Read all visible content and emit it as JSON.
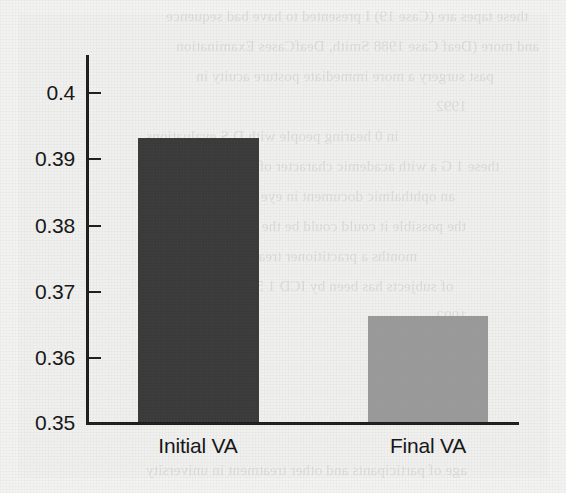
{
  "figure": {
    "kind": "scanned-journal-figure",
    "panel_background": "#f0f0ef",
    "page_background": "#f3f3f2",
    "axis_color": "#1d1d1d",
    "text_color": "#151515"
  },
  "chart_data": {
    "type": "bar",
    "title": "",
    "subtitle": "",
    "xlabel": "",
    "ylabel": "",
    "categories": [
      "Initial VA",
      "Final VA"
    ],
    "values": [
      0.393,
      0.366
    ],
    "bar_colors": [
      "#3a3a3a",
      "#9a9a9a"
    ],
    "ylim": [
      0.35,
      0.403
    ],
    "yticks": [
      0.35,
      0.36,
      0.37,
      0.38,
      0.39,
      0.4
    ],
    "ytick_labels": [
      "0.35",
      "0.36",
      "0.37",
      "0.38",
      "0.39",
      "0.4"
    ],
    "xtick_labels": [
      "Initial VA",
      "Final VA"
    ],
    "grid": false,
    "legend": false,
    "legend_position": "none",
    "tick_direction": "in",
    "series": [
      {
        "name": "Visual acuity",
        "points": [
          {
            "category": "Initial VA",
            "value": 0.393,
            "color": "#3a3a3a"
          },
          {
            "category": "Final VA",
            "value": 0.366,
            "color": "#9a9a9a"
          }
        ]
      }
    ]
  },
  "axis": {
    "y_tick_labels": [
      "0.4",
      "0.39",
      "0.38",
      "0.37",
      "0.36",
      "0.35"
    ],
    "x_tick_labels": [
      "Initial VA",
      "Final VA"
    ]
  },
  "bleed_text": {
    "note": "faint illegible show-through text from the reverse of the scanned page",
    "lines": [
      "these tapes are (Case 19) I presented to have bad sequence",
      "and more (Deaf Case 1988 Smith, DeafCases Examination",
      "past surgery a more immediate posture acuity in",
      "1992",
      "in 0 hearing people with D S evaluations",
      "these 1 G a with academic character of hearing or other",
      "an ophthalmic document in eye intervention to",
      "the possible it could could be the second in the",
      "months a practitioner treated tests in these",
      "of subjects has been by ICD 1 5 the hearing or",
      "1992",
      "age of participants and other treatment in university"
    ]
  }
}
